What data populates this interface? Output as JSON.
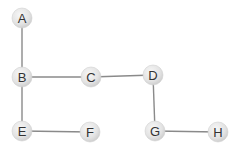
{
  "diagram": {
    "type": "tree-graph",
    "colors": {
      "edge": "#8a8a8a",
      "node_fill_light": "#f4f4f4",
      "node_fill_dark": "#d6d6d6",
      "label": "#333333"
    },
    "nodes": [
      {
        "id": "A",
        "label": "A",
        "x": 22,
        "y": 18
      },
      {
        "id": "B",
        "label": "B",
        "x": 22,
        "y": 77
      },
      {
        "id": "C",
        "label": "C",
        "x": 91,
        "y": 77
      },
      {
        "id": "D",
        "label": "D",
        "x": 153,
        "y": 75
      },
      {
        "id": "E",
        "label": "E",
        "x": 22,
        "y": 131
      },
      {
        "id": "F",
        "label": "F",
        "x": 90,
        "y": 132
      },
      {
        "id": "G",
        "label": "G",
        "x": 155,
        "y": 131
      },
      {
        "id": "H",
        "label": "H",
        "x": 218,
        "y": 132
      }
    ],
    "edges": [
      {
        "from": "A",
        "to": "B"
      },
      {
        "from": "B",
        "to": "C"
      },
      {
        "from": "C",
        "to": "D"
      },
      {
        "from": "B",
        "to": "E"
      },
      {
        "from": "E",
        "to": "F"
      },
      {
        "from": "D",
        "to": "G"
      },
      {
        "from": "G",
        "to": "H"
      }
    ]
  }
}
